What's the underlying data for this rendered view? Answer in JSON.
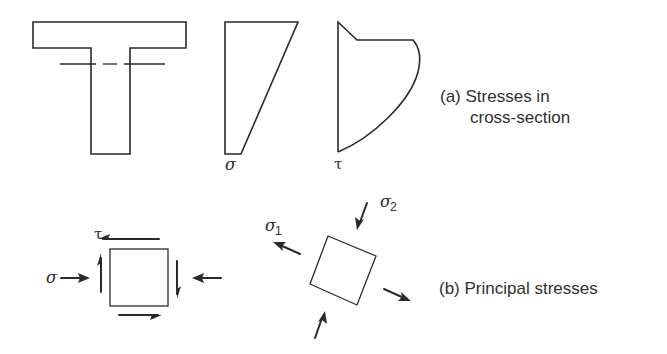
{
  "figure": {
    "part_a": {
      "caption_line1": "(a) Stresses in",
      "caption_line2": "cross-section",
      "section_shape": "T-beam cross-section with dashed neutral axis",
      "normal_stress_label": "σ",
      "shear_stress_label": "τ"
    },
    "part_b": {
      "caption": "(b) Principal stresses",
      "element_normal_label": "σ",
      "element_shear_label": "τ",
      "principal_1_label": "σ",
      "principal_1_subscript": "1",
      "principal_2_label": "σ",
      "principal_2_subscript": "2"
    }
  },
  "colors": {
    "line": "#2a2a2a",
    "text": "#2f2f2f",
    "background": "#ffffff"
  }
}
